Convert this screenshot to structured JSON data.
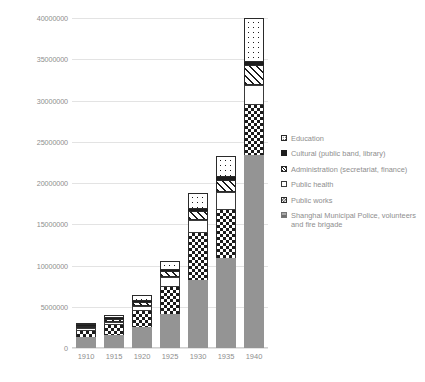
{
  "chart_data": {
    "type": "bar",
    "stacked": true,
    "title": "",
    "xlabel": "",
    "ylabel": "",
    "categories": [
      "1910",
      "1915",
      "1920",
      "1925",
      "1930",
      "1935",
      "1940"
    ],
    "ylim": [
      0,
      40000000
    ],
    "yticks": [
      0,
      5000000,
      10000000,
      15000000,
      20000000,
      25000000,
      30000000,
      35000000,
      40000000
    ],
    "ytick_labels": [
      "0",
      "5000000",
      "10000000",
      "15000000",
      "20000000",
      "25000000",
      "30000000",
      "35000000",
      "40000000"
    ],
    "grid": true,
    "legend_position": "right",
    "series": [
      {
        "name": "Shanghai Municipal Police, volunteers and fire brigade",
        "pattern": "solid-gray",
        "color": "#949494",
        "values": [
          1300000,
          1600000,
          2600000,
          4100000,
          8300000,
          10900000,
          23400000
        ]
      },
      {
        "name": "Public works",
        "pattern": "checkerboard",
        "color": "#1b1b1b",
        "values": [
          800000,
          1200000,
          1900000,
          3300000,
          5600000,
          5800000,
          6100000
        ]
      },
      {
        "name": "Public health",
        "pattern": "white",
        "color": "#ffffff",
        "values": [
          300000,
          400000,
          600000,
          1200000,
          1600000,
          2200000,
          2400000
        ]
      },
      {
        "name": "Administration (secretariat, finance)",
        "pattern": "diagonal-stripes",
        "color": "#1b1b1b",
        "values": [
          200000,
          300000,
          500000,
          700000,
          1100000,
          1500000,
          2400000
        ]
      },
      {
        "name": "Cultural (public band, library)",
        "pattern": "solid-black",
        "color": "#1d1d1d",
        "values": [
          100000,
          100000,
          150000,
          200000,
          250000,
          300000,
          400000
        ]
      },
      {
        "name": "Education",
        "pattern": "dotted",
        "color": "#1b1b1b",
        "values": [
          300000,
          400000,
          650000,
          1000000,
          2000000,
          2600000,
          5300000
        ]
      }
    ],
    "totals": [
      3000000,
      4000000,
      6400000,
      10500000,
      18850000,
      23300000,
      40000000
    ]
  },
  "legend": {
    "items": [
      {
        "label": "Education",
        "swatch": "education-swatch"
      },
      {
        "label": "Cultural (public band, library)",
        "swatch": "cultural-swatch"
      },
      {
        "label": "Administration (secretariat, finance)",
        "swatch": "administration-swatch"
      },
      {
        "label": "Public health",
        "swatch": "public-health-swatch"
      },
      {
        "label": "Public works",
        "swatch": "public-works-swatch"
      },
      {
        "label": "Shanghai Municipal Police, volunteers and fire brigade",
        "swatch": "police-swatch"
      }
    ]
  }
}
